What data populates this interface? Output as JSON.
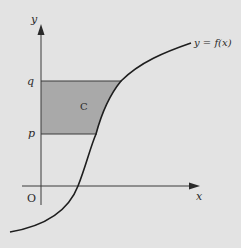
{
  "diagram": {
    "axes": {
      "x_label": "x",
      "y_label": "y",
      "origin_label": "O"
    },
    "levels": {
      "q_label": "q",
      "p_label": "p"
    },
    "region": {
      "label": "C",
      "fill": "#a9a9a9"
    },
    "curve": {
      "label": "y = f(x)"
    },
    "colors": {
      "background": "#e3e3e3",
      "line": "#2a2a2a"
    }
  }
}
